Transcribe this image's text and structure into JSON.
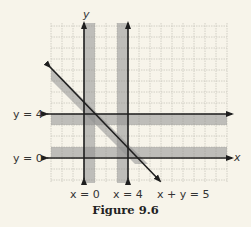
{
  "figure": {
    "caption": "Figure 9.6",
    "axis_labels": {
      "x": "x",
      "y": "y"
    },
    "grid": {
      "xmin": -3,
      "xmax": 13,
      "ymin": -2,
      "ymax": 12.5,
      "unit_px": 11,
      "origin_px": [
        84,
        158
      ]
    },
    "lines": [
      {
        "id": "x0",
        "equation": "x = 0",
        "type": "vertical",
        "value": 0,
        "shade_side": "right"
      },
      {
        "id": "x4",
        "equation": "x = 4",
        "type": "vertical",
        "value": 4,
        "shade_side": "left"
      },
      {
        "id": "y4",
        "equation": "y = 4",
        "type": "horizontal",
        "value": 4,
        "shade_side": "below"
      },
      {
        "id": "y0",
        "equation": "y = 0",
        "type": "horizontal",
        "value": 0,
        "shade_side": "above"
      },
      {
        "id": "xy5",
        "equation": "x + y = 5",
        "type": "diagonal",
        "value": 5,
        "shade_side": "below-left"
      }
    ],
    "labels": {
      "y4": "y = 4",
      "y0": "y = 0",
      "x0": "x = 0",
      "x4": "x = 4",
      "xy5": "x + y = 5"
    },
    "colors": {
      "background": "#f7f4ea",
      "grid": "#c9c6bd",
      "shade": "#8f8f8f",
      "line": "#1e1e1e"
    }
  }
}
